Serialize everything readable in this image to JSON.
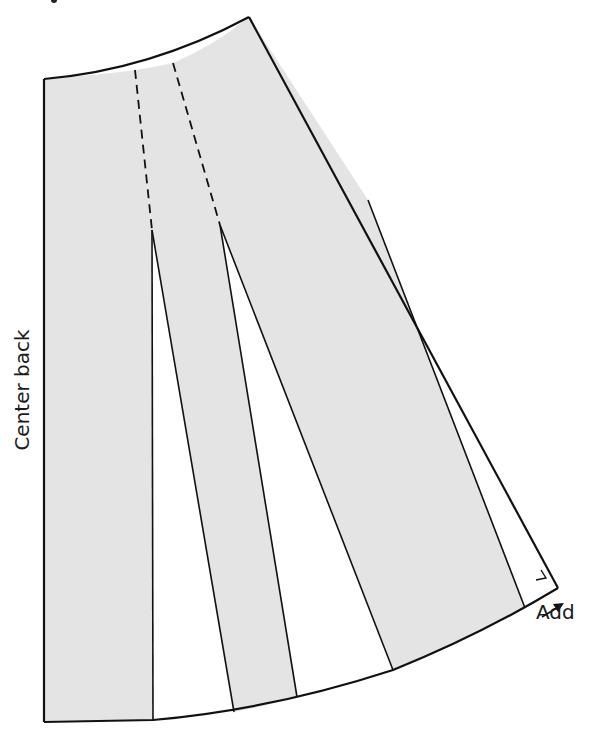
{
  "diagram": {
    "labels": {
      "center_back": "Center back",
      "add": "Add"
    },
    "colors": {
      "fill": "#e4e4e4",
      "stroke": "#111111",
      "background": "#ffffff"
    },
    "pieces": [
      {
        "name": "center-back-panel"
      },
      {
        "name": "middle-panel"
      },
      {
        "name": "side-panel"
      }
    ],
    "slashes": 3,
    "dashed_fold_lines": 2
  }
}
